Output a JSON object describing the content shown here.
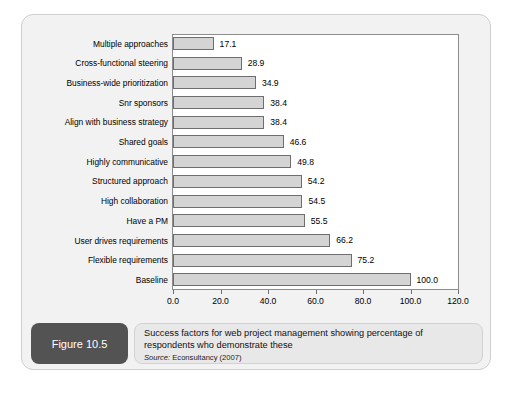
{
  "figure": {
    "badge_label": "Figure 10.5",
    "caption": "Success factors for web project management showing percentage of respondents who demonstrate these",
    "source_label": "Source:",
    "source_text": " Econsultancy (2007)"
  },
  "colors": {
    "bar_fill": "#d4d4d4",
    "bar_border": "#6e6e6e",
    "plot_background": "#ffffff",
    "card_background": "#f2f2f2",
    "badge_background": "#535353",
    "caption_background": "#e8e8e8"
  },
  "chart_data": {
    "type": "bar",
    "orientation": "horizontal",
    "title": "",
    "xlabel": "",
    "ylabel": "",
    "xlim": [
      0,
      120
    ],
    "grid": false,
    "legend": false,
    "tick_labels": [
      "0.0",
      "20.0",
      "40.0",
      "60.0",
      "80.0",
      "100.0",
      "120.0"
    ],
    "ticks": [
      0,
      20,
      40,
      60,
      80,
      100,
      120
    ],
    "categories": [
      "Multiple approaches",
      "Cross-functional steering",
      "Business-wide prioritization",
      "Snr sponsors",
      "Align with business strategy",
      "Shared goals",
      "Highly communicative",
      "Structured approach",
      "High collaboration",
      "Have a PM",
      "User drives requirements",
      "Flexible requirements",
      "Baseline"
    ],
    "values": [
      17.1,
      28.9,
      34.9,
      38.4,
      38.4,
      46.6,
      49.8,
      54.2,
      54.5,
      55.5,
      66.2,
      75.2,
      100.0
    ],
    "value_labels": [
      "17.1",
      "28.9",
      "34.9",
      "38.4",
      "38.4",
      "46.6",
      "49.8",
      "54.2",
      "54.5",
      "55.5",
      "66.2",
      "75.2",
      "100.0"
    ]
  }
}
